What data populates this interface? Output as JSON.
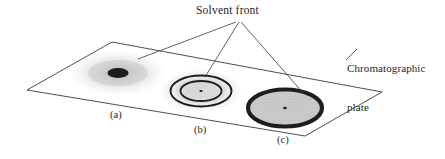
{
  "figure": {
    "title_absent": true,
    "annotations": {
      "solvent_front": "Solvent front",
      "plate_line1": "Chromatographic",
      "plate_line2": "plate"
    },
    "spot_labels": {
      "a": "(a)",
      "b": "(b)",
      "c": "(c)"
    },
    "colors": {
      "outline": "#3a3a3a",
      "leader": "#3a3a3a",
      "text": "#262626",
      "spot_dark": "#1c1c1c",
      "spot_mid": "#8c8c8c",
      "spot_light": "#cfcfcf",
      "background": "#ffffff"
    },
    "plate": {
      "shape": "parallelogram",
      "corners": [
        [
          27,
          90
        ],
        [
          112,
          42
        ],
        [
          382,
          92
        ],
        [
          305,
          136
        ]
      ]
    },
    "spots": [
      {
        "id": "a",
        "cx": 118,
        "cy": 73,
        "rx": 47,
        "ry": 22,
        "style": "diffuse-light-with-dark-core",
        "core_rx": 10,
        "core_ry": 5
      },
      {
        "id": "b",
        "cx": 201,
        "cy": 91,
        "rx": 41,
        "ry": 21,
        "style": "concentric-rings",
        "rings": [
          30,
          21,
          12
        ]
      },
      {
        "id": "c",
        "cx": 285,
        "cy": 108,
        "rx": 40,
        "ry": 20,
        "style": "thick-ring-filled"
      }
    ],
    "leaders": {
      "origin": [
        237,
        23
      ],
      "targets": [
        [
          140,
          58
        ],
        [
          205,
          78
        ],
        [
          303,
          95
        ]
      ],
      "plate_leader": [
        [
          346,
          58
        ],
        [
          357,
          49
        ]
      ]
    }
  }
}
